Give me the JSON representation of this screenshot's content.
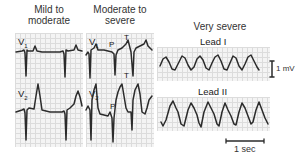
{
  "figure": {
    "columns": [
      {
        "title_line1": "Mild to",
        "title_line2": "moderate",
        "leads": [
          {
            "name": "V",
            "sub": "1"
          },
          {
            "name": "V",
            "sub": "2"
          }
        ]
      },
      {
        "title_line1": "Moderate to",
        "title_line2": "severe",
        "leads": [
          {
            "name": "V",
            "sub": "1",
            "wave_labels": [
              "P",
              "T",
              "T"
            ]
          },
          {
            "name": "V",
            "sub": "2",
            "wave_labels": [
              "P"
            ]
          }
        ]
      },
      {
        "title_line1": "Very severe",
        "leads": [
          {
            "name": "Lead I"
          },
          {
            "name": "Lead II"
          }
        ]
      }
    ],
    "scale_bars": {
      "voltage": "1 mV",
      "time": "1 sec"
    },
    "colors": {
      "trace": "#2b2b2b",
      "grid_line": "#dcdcdc",
      "grid_bg": "#f4f4f4"
    }
  }
}
